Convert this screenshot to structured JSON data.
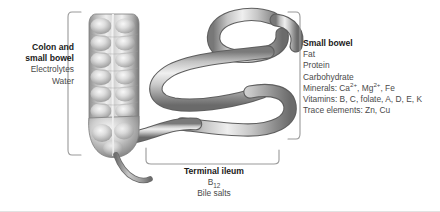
{
  "figure": {
    "name": "sites-of-nutrient-absorption-in-the-gut",
    "background": "#ffffff",
    "width": 440,
    "height": 212
  },
  "illustration": {
    "name": "intestine-illustration",
    "style": "grayscale-airbrush",
    "parts": [
      {
        "name": "colon",
        "description": "haustrated ascending colon tube, vertical, left side"
      },
      {
        "name": "cecum",
        "description": "rounded pouch at bottom of colon"
      },
      {
        "name": "appendix",
        "description": "thin curved tail below cecum"
      },
      {
        "name": "small-bowel-loops",
        "description": "smooth serpentine loops of small intestine, right side"
      },
      {
        "name": "terminal-ileum",
        "description": "final small bowel segment joining the cecum"
      }
    ],
    "colors": {
      "tube_dark": "#6f6f6f",
      "tube_mid": "#a8a8a8",
      "tube_light": "#e8e8e8",
      "tube_outline": "#5d5d5d"
    }
  },
  "brackets": {
    "colon_bracket": {
      "name": "left-bracket",
      "orientation": "left",
      "color": "#9a9a9a"
    },
    "small_bowel_bracket": {
      "name": "right-bracket",
      "orientation": "right",
      "color": "#9a9a9a"
    },
    "terminal_ileum_bracket": {
      "name": "bottom-bracket",
      "orientation": "down",
      "color": "#9a9a9a"
    }
  },
  "labels": {
    "colon_and_small_bowel": {
      "title": "Colon and",
      "title2": "small bowel",
      "items": [
        "Electrolytes",
        "Water"
      ]
    },
    "small_bowel": {
      "title": "Small bowel",
      "items": [
        "Fat",
        "Protein",
        "Carbohydrate"
      ],
      "minerals_prefix": "Minerals: Ca",
      "minerals_sup1": "2+",
      "minerals_mid": ", Mg",
      "minerals_sup2": "2+",
      "minerals_suffix": ", Fe",
      "vitamins": "Vitamins: B, C, folate, A, D, E, K",
      "trace_elements": "Trace elements: Zn, Cu"
    },
    "terminal_ileum": {
      "title": "Terminal ileum",
      "b12_prefix": "B",
      "b12_sub": "12",
      "bile_salts": "Bile salts"
    }
  }
}
